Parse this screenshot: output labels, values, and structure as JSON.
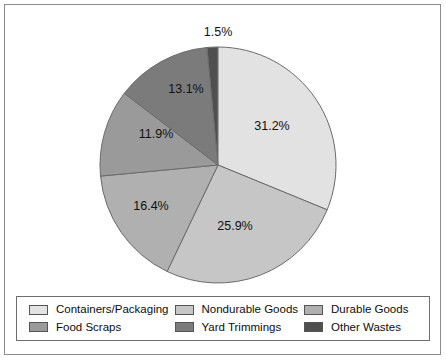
{
  "chart_data": {
    "type": "pie",
    "title": "",
    "subtitle": "",
    "xlabel": "",
    "ylabel": "",
    "grid": false,
    "legend_position": "bottom",
    "start_angle_deg": -5.4,
    "direction": "clockwise",
    "categories": [
      "Other Wastes",
      "Containers/Packaging",
      "Nondurable Goods",
      "Durable Goods",
      "Food Scraps",
      "Yard Trimmings"
    ],
    "values": [
      1.5,
      31.2,
      25.9,
      16.4,
      11.9,
      13.1
    ],
    "labels": [
      "1.5%",
      "31.2%",
      "25.9%",
      "16.4%",
      "11.9%",
      "13.1%"
    ],
    "colors": [
      "#4f4f4f",
      "#e2e2e2",
      "#c6c6c6",
      "#b0b0b0",
      "#9a9a9a",
      "#7b7b7b"
    ],
    "slices": [
      {
        "name": "Other Wastes",
        "value": 1.5,
        "label": "1.5%",
        "color": "#4f4f4f",
        "label_x": 218,
        "label_y": 32,
        "label_outside": true
      },
      {
        "name": "Containers/Packaging",
        "value": 31.2,
        "label": "31.2%",
        "color": "#e2e2e2",
        "label_x": 272,
        "label_y": 126,
        "label_outside": false
      },
      {
        "name": "Nondurable Goods",
        "value": 25.9,
        "label": "25.9%",
        "color": "#c6c6c6",
        "label_x": 235,
        "label_y": 226,
        "label_outside": false
      },
      {
        "name": "Durable Goods",
        "value": 16.4,
        "label": "16.4%",
        "color": "#b0b0b0",
        "label_x": 151,
        "label_y": 206,
        "label_outside": false
      },
      {
        "name": "Food Scraps",
        "value": 11.9,
        "label": "11.9%",
        "color": "#9a9a9a",
        "label_x": 156,
        "label_y": 134,
        "label_outside": false
      },
      {
        "name": "Yard Trimmings",
        "value": 13.1,
        "label": "13.1%",
        "color": "#7b7b7b",
        "label_x": 186,
        "label_y": 89,
        "label_outside": false
      }
    ],
    "geometry": {
      "cx": 218,
      "cy": 165,
      "r": 118
    }
  },
  "legend": {
    "entries": [
      {
        "label": "Containers/Packaging",
        "color": "#e2e2e2"
      },
      {
        "label": "Nondurable Goods",
        "color": "#c6c6c6"
      },
      {
        "label": "Durable Goods",
        "color": "#b0b0b0"
      },
      {
        "label": "Food Scraps",
        "color": "#9a9a9a"
      },
      {
        "label": "Yard Trimmings",
        "color": "#7b7b7b"
      },
      {
        "label": "Other Wastes",
        "color": "#4f4f4f"
      }
    ],
    "order_by_cell": [
      0,
      1,
      2,
      3,
      4,
      5
    ]
  },
  "style": {
    "slice_stroke": "#6b6b6b",
    "frame_color": "#8c8c8c",
    "legend_border": "#6e6e6e",
    "background": "#ffffff",
    "label_color": "#111111"
  }
}
